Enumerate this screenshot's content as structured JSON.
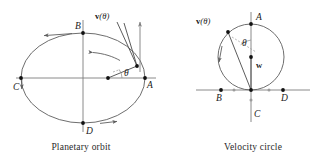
{
  "figure": {
    "title_left": "Planetary orbit",
    "title_right": "Velocity circle",
    "stroke_curve": "#5d5d5d",
    "stroke_axis": "#7e7e7e",
    "dot_color": "#111111"
  },
  "left_diagram": {
    "name": "planetary-orbit",
    "caption": "Planetary orbit",
    "labels": {
      "A": "A",
      "B": "B",
      "C": "C",
      "D": "D",
      "theta": "θ",
      "velocity_bold": "v",
      "velocity_arg": "(θ)"
    }
  },
  "right_diagram": {
    "name": "velocity-circle",
    "caption": "Velocity circle",
    "labels": {
      "A": "A",
      "B": "B",
      "C": "C",
      "D": "D",
      "theta": "θ",
      "velocity_bold": "v",
      "velocity_arg": "(θ)",
      "w_bold": "w"
    }
  }
}
